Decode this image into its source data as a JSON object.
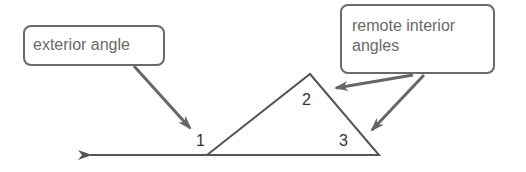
{
  "diagram": {
    "callouts": {
      "exterior": {
        "label": "exterior angle"
      },
      "remote": {
        "label": "remote interior angles",
        "line1": "remote interior",
        "line2": "angles"
      }
    },
    "angles": {
      "angle1": "1",
      "angle2": "2",
      "angle3": "3"
    },
    "colors": {
      "line": "#555555",
      "arrow": "#666666",
      "callout_border": "#6a6a6a",
      "text": "#6a6a6a"
    }
  }
}
